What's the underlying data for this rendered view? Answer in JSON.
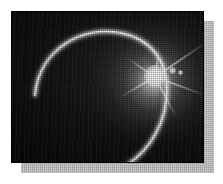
{
  "page": {
    "background_color": "#ffffff",
    "width": 223,
    "height": 184
  },
  "figure": {
    "name": "eclipse-photograph",
    "caption": "",
    "frame": {
      "left": 11,
      "top": 11,
      "width": 193,
      "height": 152,
      "border_color": "#000000"
    },
    "shadow": {
      "color": "#9a9a9a",
      "offset_x": 10,
      "offset_y": 10
    },
    "palette": {
      "sky_dark": "#0a0a0a",
      "sky_mid": "#2a2a2a",
      "highlight": "#ffffff",
      "corona_glow": "#dcdcdc",
      "shadow_gray": "#9a9a9a"
    },
    "elements": {
      "corona_label": "corona glow",
      "crescent_label": "crescent limb arc",
      "flare_label": "starburst flare",
      "flare_dot_label": "secondary lens flare"
    }
  }
}
